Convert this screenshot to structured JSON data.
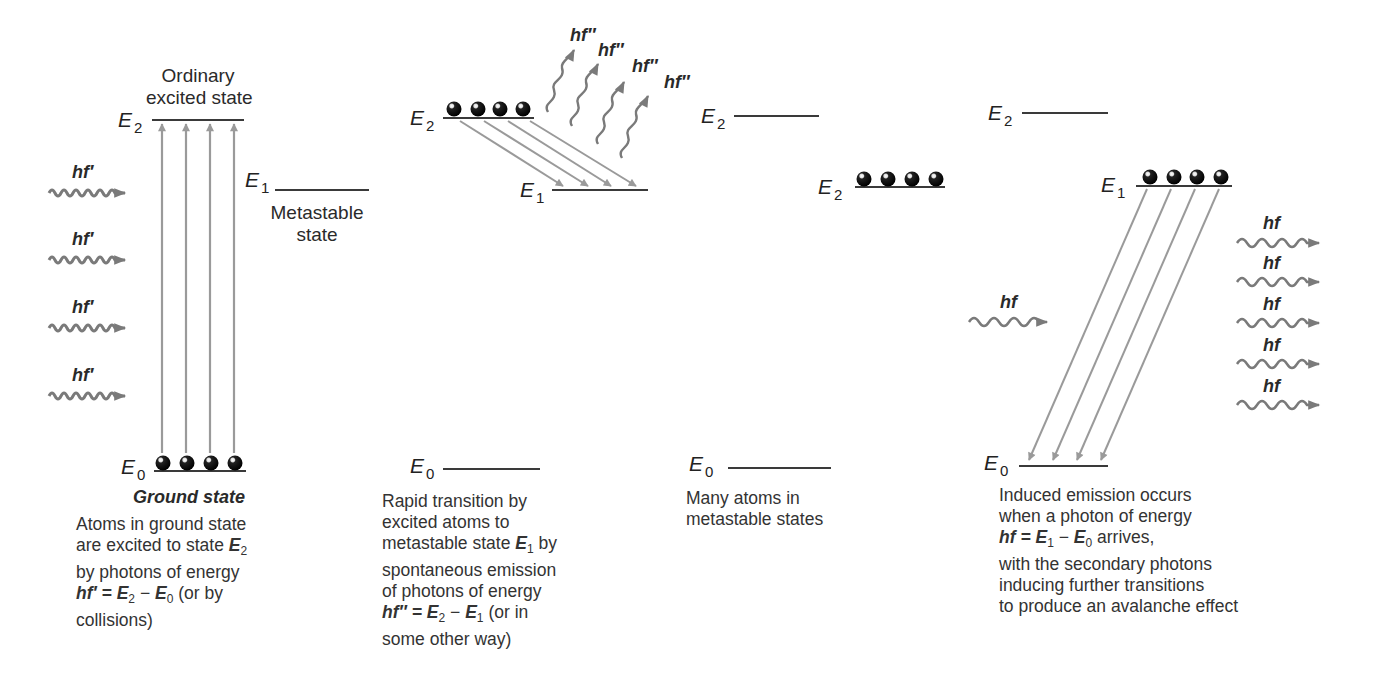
{
  "panels": [
    {
      "id": "excitation",
      "state_labels": {
        "ordinary_line1": "Ordinary",
        "ordinary_line2": "excited state",
        "metastable_line1": "Metastable",
        "metastable_line2": "state",
        "ground": "Ground state"
      },
      "levels": {
        "E2": {
          "symbol": "E",
          "sub": "2"
        },
        "E1": {
          "symbol": "E",
          "sub": "1"
        },
        "E0": {
          "symbol": "E",
          "sub": "0"
        }
      },
      "photon_label": "hf′",
      "photon_count": 4,
      "atom_count": 4,
      "caption": {
        "line1": "Atoms in ground state",
        "line2_text": "are excited to state ",
        "line2_sym": "E",
        "line2_sub": "2",
        "line3": "by photons of energy",
        "line4_eq_lhs": "hf′ = ",
        "line4_e2": "E",
        "line4_e2_sub": "2",
        "line4_minus": " − ",
        "line4_e0": "E",
        "line4_e0_sub": "0",
        "line4_tail": " (or by",
        "line5": "collisions)"
      }
    },
    {
      "id": "spontaneous-emission",
      "levels": {
        "E2": {
          "symbol": "E",
          "sub": "2"
        },
        "E1": {
          "symbol": "E",
          "sub": "1"
        },
        "E0": {
          "symbol": "E",
          "sub": "0"
        }
      },
      "photon_label": "hf″",
      "photon_count": 4,
      "atom_count": 4,
      "caption": {
        "line1": "Rapid transition by",
        "line2": "excited atoms to",
        "line3_text": "metastable state ",
        "line3_sym": "E",
        "line3_sub": "1",
        "line3_tail": " by",
        "line4": "spontaneous emission",
        "line5": "of photons of energy",
        "line6_eq_lhs": "hf″ = ",
        "line6_e2": "E",
        "line6_e2_sub": "2",
        "line6_minus": " − ",
        "line6_e1": "E",
        "line6_e1_sub": "1",
        "line6_tail": " (or in",
        "line7": "some other way)"
      }
    },
    {
      "id": "population-inversion",
      "levels": {
        "top": {
          "symbol": "E",
          "sub": "2"
        },
        "middle": {
          "symbol": "E",
          "sub": "2"
        },
        "E0": {
          "symbol": "E",
          "sub": "0"
        }
      },
      "atom_count": 4,
      "caption": {
        "line1": "Many atoms in",
        "line2": "metastable states"
      }
    },
    {
      "id": "induced-emission",
      "levels": {
        "E2": {
          "symbol": "E",
          "sub": "2"
        },
        "E1": {
          "symbol": "E",
          "sub": "1"
        },
        "E0": {
          "symbol": "E",
          "sub": "0"
        }
      },
      "incoming_photon_label": "hf",
      "outgoing_photon_labels": [
        "hf",
        "hf",
        "hf",
        "hf",
        "hf"
      ],
      "atom_count": 4,
      "caption": {
        "line1": "Induced emission occurs",
        "line2": "when a photon of energy",
        "line3_eq_lhs": "hf = ",
        "line3_e1": "E",
        "line3_e1_sub": "1",
        "line3_minus": " − ",
        "line3_e0": "E",
        "line3_e0_sub": "0",
        "line3_tail": " arrives,",
        "line4": "with the secondary photons",
        "line5": "inducing further transitions",
        "line6": "to produce an avalanche effect"
      }
    }
  ],
  "colors": {
    "level_line": "#3a3a3a",
    "arrow": "#9a9a9a",
    "photon": "#7a7a7a",
    "atom": "#111111",
    "text": "#2a2a2a"
  }
}
